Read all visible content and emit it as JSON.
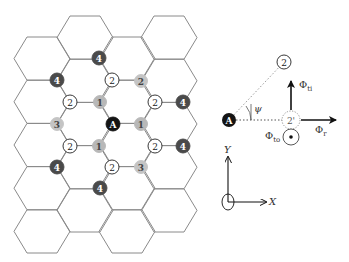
{
  "colors": {
    "hex_stroke": "#8a8a8a",
    "site_A": "#141414",
    "site_1": "#b8b8b8",
    "site_2_fill": "#ffffff",
    "site_2_grey": "#c4c4c4",
    "site_3": "#c4c4c4",
    "site_4": "#4a4a4a",
    "arrow": "#111111",
    "dotted": "#9a9a9a"
  },
  "lattice": {
    "columns": [
      {
        "x_left": 14,
        "top": 37,
        "count": 5
      },
      {
        "x_left": 57,
        "top": 16,
        "count": 5
      },
      {
        "x_left": 99,
        "top": 37,
        "count": 5
      },
      {
        "x_left": 141,
        "top": 16,
        "count": 5
      }
    ],
    "hex_width": 56,
    "hex_inset": 13,
    "hex_height": 43.2
  },
  "nodes": [
    {
      "label": "4",
      "type": "4",
      "x": 99,
      "y": 58
    },
    {
      "label": "4",
      "type": "4",
      "x": 57,
      "y": 80
    },
    {
      "label": "2",
      "type": "2",
      "x": 112,
      "y": 80
    },
    {
      "label": "2",
      "type": "2g",
      "x": 141,
      "y": 81
    },
    {
      "label": "2",
      "type": "2",
      "x": 70,
      "y": 102
    },
    {
      "label": "1",
      "type": "1",
      "x": 100,
      "y": 102
    },
    {
      "label": "2",
      "type": "2",
      "x": 155,
      "y": 102
    },
    {
      "label": "4",
      "type": "4",
      "x": 183,
      "y": 102
    },
    {
      "label": "3",
      "type": "3",
      "x": 57,
      "y": 124
    },
    {
      "label": "A",
      "type": "A",
      "x": 113,
      "y": 124
    },
    {
      "label": "1",
      "type": "1",
      "x": 141,
      "y": 124
    },
    {
      "label": "2",
      "type": "2",
      "x": 70,
      "y": 146
    },
    {
      "label": "1",
      "type": "1",
      "x": 99,
      "y": 146
    },
    {
      "label": "2",
      "type": "2",
      "x": 155,
      "y": 146
    },
    {
      "label": "4",
      "type": "4",
      "x": 183,
      "y": 146
    },
    {
      "label": "4",
      "type": "4",
      "x": 57,
      "y": 167
    },
    {
      "label": "2",
      "type": "2",
      "x": 112,
      "y": 167
    },
    {
      "label": "3",
      "type": "3",
      "x": 141,
      "y": 167
    },
    {
      "label": "4",
      "type": "4",
      "x": 100,
      "y": 188
    }
  ],
  "geometry_diagram": {
    "site_A": {
      "label": "A",
      "x": 229,
      "y": 120
    },
    "site_2": {
      "label": "2",
      "x": 284,
      "y": 62
    },
    "site_2_prime": {
      "label": "2'",
      "x": 291,
      "y": 120
    },
    "angle_label": "ψ",
    "phi_ti": {
      "symbol": "Φ",
      "sub": "ti"
    },
    "phi_r": {
      "symbol": "Φ",
      "sub": "r"
    },
    "phi_to": {
      "symbol": "Φ",
      "sub": "to"
    }
  },
  "axes": {
    "x_label": "X",
    "y_label": "Y"
  }
}
